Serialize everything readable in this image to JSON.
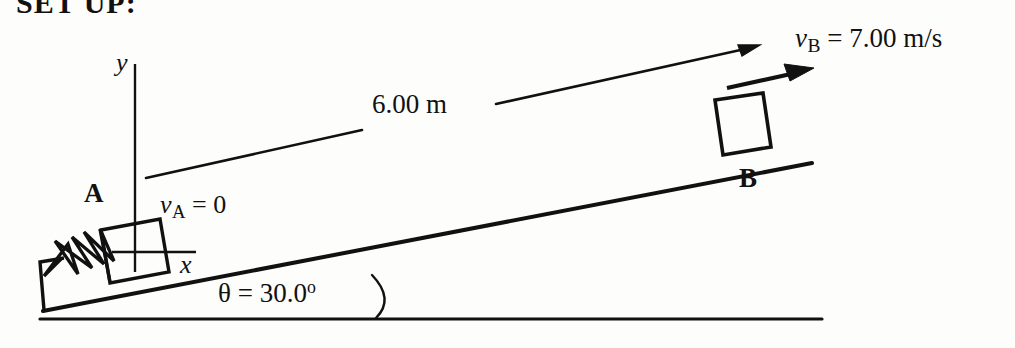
{
  "figure": {
    "title": "SET UP:",
    "ink_color": "#111111",
    "background_color": "#fdfdfc",
    "labels": {
      "velocity_b": {
        "symbol": "v",
        "subscript": "B",
        "equals": " = ",
        "value": "7.00 m/s"
      },
      "velocity_a": {
        "symbol": "v",
        "subscript": "A",
        "equals": " = ",
        "value": "0"
      },
      "distance": "6.00 m",
      "angle": {
        "symbol": "θ",
        "equals": " = ",
        "value": "30.0",
        "degree": "o"
      },
      "block_a": "A",
      "block_b": "B",
      "axis_y": "y",
      "axis_x": "x"
    },
    "elements": {
      "ground_line": "ground-line",
      "incline_line": "incline-surface",
      "spring": "spring-coil",
      "wall_bracket": "spring-anchor-wall",
      "block_a_shape": "block-a",
      "block_b_shape": "block-b",
      "distance_arrow": "distance-arrow",
      "velocity_arrow": "velocity-arrow-b",
      "angle_arc": "angle-arc",
      "y_axis": "y-axis-line",
      "x_axis": "x-axis-line"
    }
  }
}
